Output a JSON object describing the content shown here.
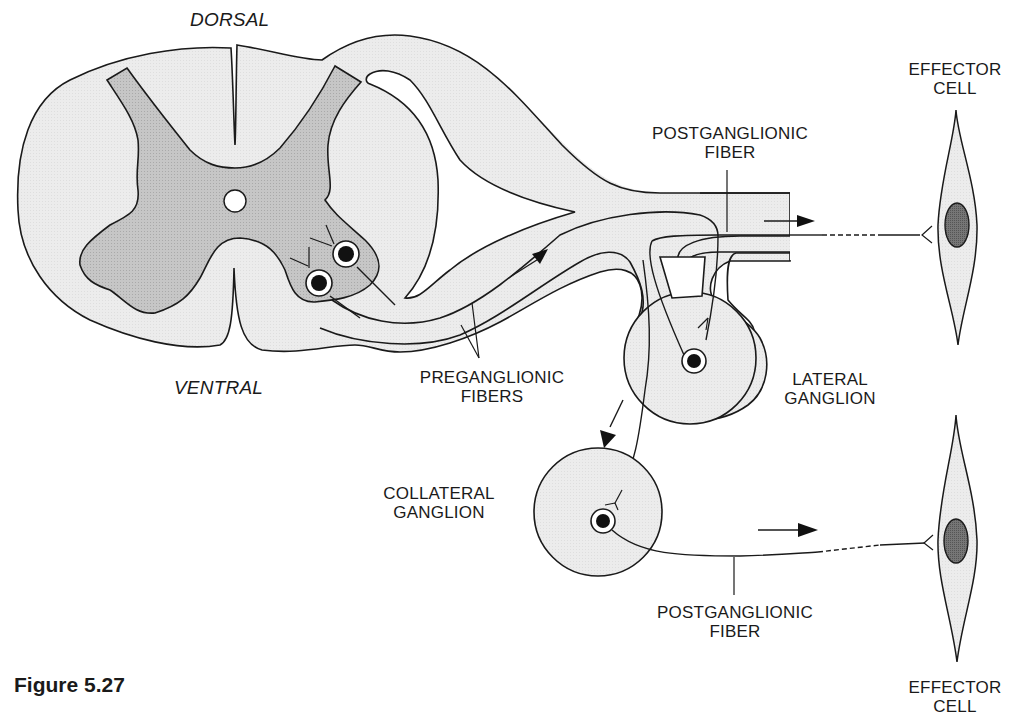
{
  "figure": {
    "title": "Figure 5.27",
    "orientation_labels": {
      "dorsal": "DORSAL",
      "ventral": "VENTRAL"
    },
    "labels": {
      "postganglionic_upper": {
        "line1": "POSTGANGLIONIC",
        "line2": "FIBER"
      },
      "effector_upper": {
        "line1": "EFFECTOR",
        "line2": "CELL"
      },
      "preganglionic": {
        "line1": "PREGANGLIONIC",
        "line2": "FIBERS"
      },
      "lateral_ganglion": {
        "line1": "LATERAL",
        "line2": "GANGLION"
      },
      "collateral_ganglion": {
        "line1": "COLLATERAL",
        "line2": "GANGLION"
      },
      "postganglionic_lower": {
        "line1": "POSTGANGLIONIC",
        "line2": "FIBER"
      },
      "effector_lower": {
        "line1": "EFFECTOR",
        "line2": "CELL"
      }
    },
    "colors": {
      "white_matter": "#ededed",
      "gray_matter": "#c8c8c8",
      "nucleus": "#707070",
      "outline": "#1a1a1a"
    }
  }
}
